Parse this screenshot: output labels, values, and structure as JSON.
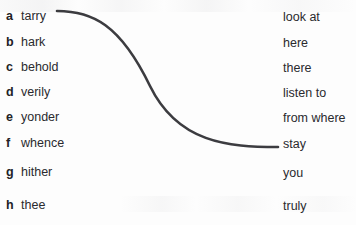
{
  "exercise": {
    "type": "vocabulary-matching",
    "terms": [
      {
        "letter": "a",
        "word": "tarry",
        "top": 7
      },
      {
        "letter": "b",
        "word": "hark",
        "top": 33
      },
      {
        "letter": "c",
        "word": "behold",
        "top": 58
      },
      {
        "letter": "d",
        "word": "verily",
        "top": 83
      },
      {
        "letter": "e",
        "word": "yonder",
        "top": 108
      },
      {
        "letter": "f",
        "word": "whence",
        "top": 134
      },
      {
        "letter": "g",
        "word": "hither",
        "top": 163
      },
      {
        "letter": "h",
        "word": "thee",
        "top": 196
      }
    ],
    "definitions": [
      {
        "text": "look at",
        "top": 7
      },
      {
        "text": "here",
        "top": 33
      },
      {
        "text": "there",
        "top": 58
      },
      {
        "text": "listen to",
        "top": 83
      },
      {
        "text": "from where",
        "top": 108
      },
      {
        "text": "stay",
        "top": 134
      },
      {
        "text": "you",
        "top": 163
      },
      {
        "text": "truly",
        "top": 196
      }
    ],
    "connections": [
      {
        "from_term": "tarry",
        "to_definition": "stay",
        "path": "M 57 11 C 92 11, 120 24, 150 86 C 178 143, 228 147, 278 147",
        "color": "#3c3c40",
        "width": 2.6
      }
    ],
    "colors": {
      "background": "#fdfdfd",
      "text": "#2a2a2e",
      "letter": "#222226",
      "curve": "#3c3c40"
    }
  }
}
